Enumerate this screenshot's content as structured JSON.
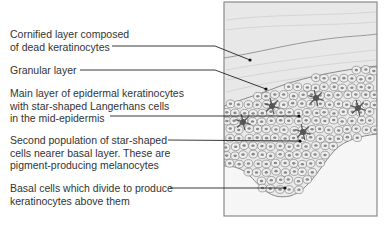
{
  "labels": [
    {
      "id": "cornified",
      "lines": [
        "Cornified layer composed",
        "of dead keratinocytes"
      ]
    },
    {
      "id": "granular",
      "lines": [
        "Granular layer"
      ]
    },
    {
      "id": "main-layer",
      "lines": [
        "Main layer of epidermal keratinocytes",
        "with star-shaped Langerhans cells",
        "in the mid-epidermis"
      ]
    },
    {
      "id": "melanocytes",
      "lines": [
        "Second population of star-shaped",
        "cells nearer basal layer. These are",
        "pigment-producing melanocytes"
      ]
    },
    {
      "id": "basal",
      "lines": [
        "Basal cells which divide to produce",
        "keratinocytes above them"
      ]
    }
  ],
  "colors": {
    "text": "#333333",
    "leader": "#222222",
    "frame": "#888888",
    "cornified_fill": "#e6e6e6",
    "cell_fill": "#eeeeee",
    "cell_stroke": "#777777",
    "nucleus": "#8a8a8a",
    "star_cell": "#555555",
    "dermis_fill": "#f4f4f4"
  }
}
